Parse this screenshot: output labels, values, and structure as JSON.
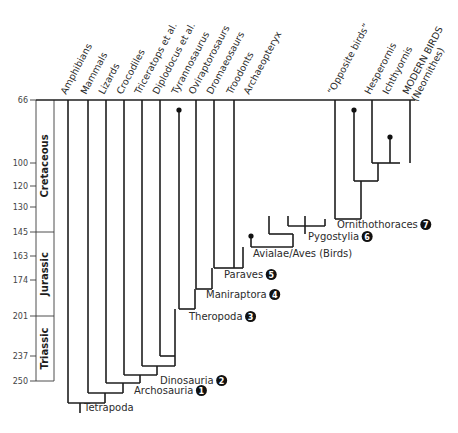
{
  "diagram": {
    "type": "cladogram",
    "time_axis": {
      "unit": "million years ago",
      "ticks": [
        66,
        100,
        120,
        130,
        145,
        163,
        174,
        201,
        237,
        250
      ]
    },
    "periods": [
      {
        "name": "Cretaceous",
        "start": 145,
        "end": 66
      },
      {
        "name": "Jurassic",
        "start": 201,
        "end": 145
      },
      {
        "name": "Triassic",
        "start": 250,
        "end": 201
      }
    ],
    "taxa": [
      {
        "name": "Amphibians",
        "extinct": false
      },
      {
        "name": "Mammals",
        "extinct": false
      },
      {
        "name": "Lizards",
        "extinct": false
      },
      {
        "name": "Crocodiles",
        "extinct": false
      },
      {
        "name": "Triceratops et al.",
        "extinct": false
      },
      {
        "name": "Diplodocus et al.",
        "extinct": false
      },
      {
        "name": "Tyrannosaurus",
        "extinct": true
      },
      {
        "name": "Oviraptorosaurs",
        "extinct": false
      },
      {
        "name": "Dromaeosaurs",
        "extinct": false
      },
      {
        "name": "Troodonts",
        "extinct": false
      },
      {
        "name": "Archaeopteryx",
        "extinct": true
      },
      {
        "name": "“Opposite birds”",
        "extinct": false
      },
      {
        "name": "Hesperornis",
        "extinct": true
      },
      {
        "name": "Ichthyornis",
        "extinct": true
      },
      {
        "name": "MODERN BIRDS",
        "name2": "(Neornithes)",
        "extinct": false
      }
    ],
    "clades": [
      {
        "name": "Tetrapoda",
        "badge": null
      },
      {
        "name": "Archosauria",
        "badge": "1"
      },
      {
        "name": "Dinosauria",
        "badge": "2"
      },
      {
        "name": "Theropoda",
        "badge": "3"
      },
      {
        "name": "Maniraptora",
        "badge": "4"
      },
      {
        "name": "Paraves",
        "badge": "5"
      },
      {
        "name": "Avialae/Aves (Birds)",
        "badge": null
      },
      {
        "name": "Pygostylia",
        "badge": "6"
      },
      {
        "name": "Ornithothoraces",
        "badge": "7"
      }
    ]
  }
}
